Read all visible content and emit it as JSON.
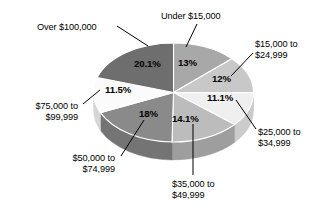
{
  "chart_data": {
    "type": "pie",
    "title": "",
    "subtitle": "",
    "xlabel": "",
    "ylabel": "",
    "legend_position": "none",
    "grid": false,
    "labels_style": "leader-lines with percentage callouts",
    "categories": [
      "Under $15,000",
      "$15,000 to\n$24,999",
      "$25,000 to\n$34,999",
      "$35,000 to\n$49,999",
      "$50,000 to\n$74,999",
      "$75,000 to\n$99,999",
      "Over $100,000"
    ],
    "values": [
      13,
      12,
      11.1,
      14.1,
      18,
      11.5,
      20.1
    ],
    "value_labels": [
      "13%",
      "12%",
      "11.1%",
      "14.1%",
      "18%",
      "11.5%",
      "20.1%"
    ],
    "colors": [
      "#a8a8a8",
      "#c8c8c8",
      "#efefef",
      "#bcbcbc",
      "#8a8a8a",
      "#fbfbfb",
      "#6e6e6e"
    ],
    "side_colors": [
      "#8d8d8d",
      "#a9a9a9",
      "#cbcbcb",
      "#9e9e9e",
      "#747474",
      "#d6d6d6",
      "#5c5c5c"
    ]
  },
  "slices": [
    {
      "id": "under-15000",
      "category": "Under $15,000",
      "percent_label": "13%",
      "value": 13,
      "fill": "#a8a8a8",
      "side_fill": "#8d8d8d",
      "pct_x": 178,
      "pct_y": 57,
      "label_lines": [
        "Under $15,000"
      ],
      "label_x": 161,
      "label_y": 11,
      "label_align": "left-align",
      "leader": {
        "x1": 197,
        "y1": 24,
        "x2": 186,
        "y2": 47
      }
    },
    {
      "id": "15000-24999",
      "category": "$15,000 to $24,999",
      "percent_label": "12%",
      "value": 12,
      "fill": "#c8c8c8",
      "side_fill": "#a9a9a9",
      "pct_x": 212,
      "pct_y": 73,
      "label_lines": [
        "$15,000 to",
        "$24,999"
      ],
      "label_x": 255,
      "label_y": 39,
      "label_align": "left-align",
      "leader": {
        "x1": 253,
        "y1": 53,
        "x2": 231,
        "y2": 76
      }
    },
    {
      "id": "25000-34999",
      "category": "$25,000 to $34,999",
      "percent_label": "11.1%",
      "value": 11.1,
      "fill": "#efefef",
      "side_fill": "#cbcbcb",
      "pct_x": 207,
      "pct_y": 92,
      "label_lines": [
        "$25,000 to",
        "$34,999"
      ],
      "label_x": 258,
      "label_y": 127,
      "label_align": "left-align",
      "leader": {
        "x1": 256,
        "y1": 129,
        "x2": 236,
        "y2": 100
      }
    },
    {
      "id": "35000-49999",
      "category": "$35,000 to $49,999",
      "percent_label": "14.1%",
      "value": 14.1,
      "fill": "#bcbcbc",
      "side_fill": "#9e9e9e",
      "pct_x": 172,
      "pct_y": 113,
      "label_lines": [
        "$35,000 to",
        "$49,999"
      ],
      "label_x": 172,
      "label_y": 179,
      "label_align": "left-align",
      "leader": {
        "x1": 193,
        "y1": 175,
        "x2": 193,
        "y2": 124
      }
    },
    {
      "id": "50000-74999",
      "category": "$50,000 to $74,999",
      "percent_label": "18%",
      "value": 18,
      "fill": "#8a8a8a",
      "side_fill": "#747474",
      "pct_x": 139,
      "pct_y": 108,
      "label_lines": [
        "$50,000 to",
        "$74,999"
      ],
      "label_x": 55,
      "label_y": 153,
      "label_align": "right-align",
      "leader": {
        "x1": 121,
        "y1": 156,
        "x2": 144,
        "y2": 120
      }
    },
    {
      "id": "75000-99999",
      "category": "$75,000 to $99,999",
      "percent_label": "11.5%",
      "value": 11.5,
      "fill": "#fbfbfb",
      "side_fill": "#d6d6d6",
      "pct_x": 105,
      "pct_y": 84,
      "label_lines": [
        "$75,000 to",
        "$99,999"
      ],
      "label_x": 18,
      "label_y": 101,
      "label_align": "right-align",
      "leader": {
        "x1": 83,
        "y1": 104,
        "x2": 100,
        "y2": 90
      }
    },
    {
      "id": "over-100000",
      "category": "Over $100,000",
      "percent_label": "20.1%",
      "value": 20.1,
      "fill": "#6e6e6e",
      "side_fill": "#5c5c5c",
      "pct_x": 134,
      "pct_y": 58,
      "label_lines": [
        "Over $100,000"
      ],
      "label_x": 37,
      "label_y": 22,
      "label_align": "left-align",
      "leader": {
        "x1": 117,
        "y1": 26,
        "x2": 148,
        "y2": 46
      }
    }
  ]
}
